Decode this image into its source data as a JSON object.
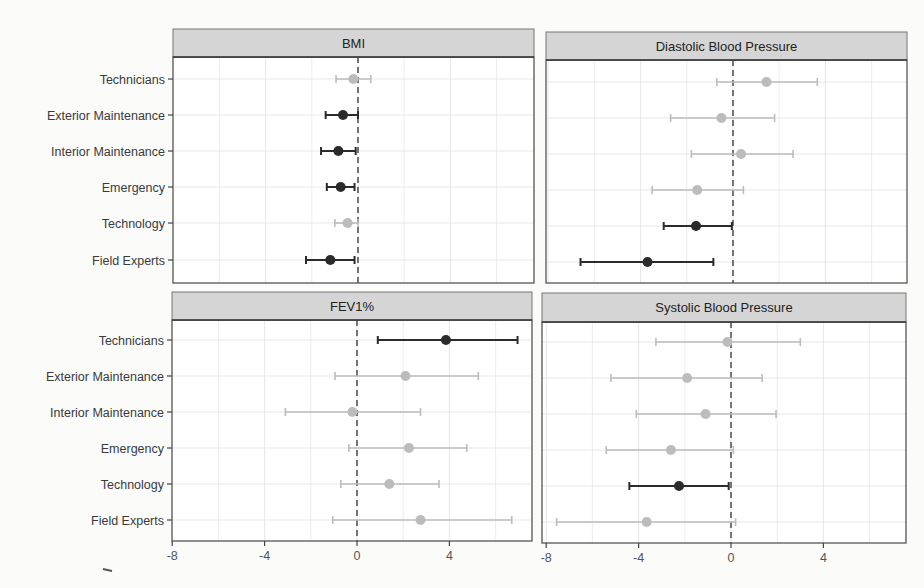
{
  "chart_data": {
    "type": "forest",
    "layout": {
      "rows": 2,
      "cols": 2,
      "shared_x": true
    },
    "categories": [
      "Technicians",
      "Exterior Maintenance",
      "Interior Maintenance",
      "Emergency",
      "Technology",
      "Field Experts"
    ],
    "xlim": [
      -8,
      7.5
    ],
    "xticks": [
      -8,
      -4,
      0,
      4
    ],
    "reference_line": {
      "x": 0,
      "style": "dashed"
    },
    "grid": true,
    "colors": {
      "significant": "#2b2b2b",
      "nonsignificant": "#bcbcbc",
      "strip_fill": "#d5d5d5",
      "panel_border": "#555555",
      "grid": "#e7e7e7",
      "ref_line": "#555555"
    },
    "panels": [
      {
        "title": "BMI",
        "estimates": [
          -0.2,
          -0.65,
          -0.85,
          -0.75,
          -0.45,
          -1.2
        ],
        "lower": [
          -0.95,
          -1.4,
          -1.6,
          -1.35,
          -1.0,
          -2.25
        ],
        "upper": [
          0.55,
          0.0,
          -0.1,
          -0.15,
          0.0,
          -0.15
        ],
        "significant": [
          false,
          true,
          true,
          true,
          false,
          true
        ]
      },
      {
        "title": "Diastolic Blood Pressure",
        "estimates": [
          1.45,
          -0.5,
          0.35,
          -1.55,
          -1.6,
          -3.7
        ],
        "lower": [
          -0.7,
          -2.7,
          -1.8,
          -3.5,
          -3.0,
          -6.6
        ],
        "upper": [
          3.65,
          1.8,
          2.6,
          0.45,
          -0.05,
          -0.85
        ],
        "significant": [
          false,
          false,
          false,
          false,
          true,
          true
        ]
      },
      {
        "title": "FEV1%",
        "estimates": [
          3.85,
          2.1,
          -0.2,
          2.25,
          1.4,
          2.75
        ],
        "lower": [
          0.9,
          -0.95,
          -3.1,
          -0.35,
          -0.7,
          -1.05
        ],
        "upper": [
          6.95,
          5.25,
          2.75,
          4.75,
          3.55,
          6.7
        ],
        "significant": [
          true,
          false,
          false,
          false,
          false,
          false
        ]
      },
      {
        "title": "Systolic Blood Pressure",
        "estimates": [
          -0.15,
          -1.9,
          -1.1,
          -2.6,
          -2.25,
          -3.65
        ],
        "lower": [
          -3.25,
          -5.2,
          -4.1,
          -5.4,
          -4.4,
          -7.55
        ],
        "upper": [
          3.0,
          1.35,
          1.95,
          0.1,
          -0.1,
          0.2
        ],
        "significant": [
          false,
          false,
          false,
          false,
          true,
          false
        ]
      }
    ],
    "title": "",
    "xlabel": "",
    "ylabel": "",
    "legend": null
  }
}
